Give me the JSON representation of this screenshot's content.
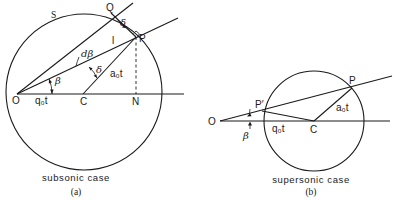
{
  "figure_a": {
    "caption": "subsonic case",
    "sublabel": "(a)",
    "labels": {
      "wavefront": "S",
      "origin": "O",
      "center": "C",
      "foot": "N",
      "point_p": "P",
      "point_q": "Q",
      "ray_marker": "l",
      "beta": "β",
      "d_beta": "dβ",
      "delta_inner": "δ",
      "delta_outer": "δ",
      "segment_oc": "q₀t",
      "radius_cp": "a₀t"
    }
  },
  "figure_b": {
    "caption": "supersonic case",
    "sublabel": "(b)",
    "labels": {
      "origin": "O",
      "center": "C",
      "point_p": "P",
      "point_p_prime": "P′",
      "beta": "β",
      "segment_oc": "q₀t",
      "radius_cp": "a₀t"
    }
  }
}
